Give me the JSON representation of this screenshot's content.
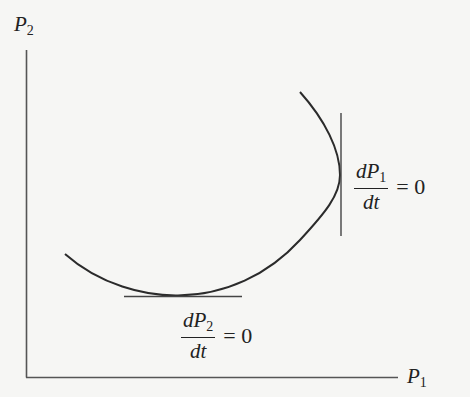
{
  "diagram": {
    "axes": {
      "y_label": {
        "var": "P",
        "sub": "2"
      },
      "x_label": {
        "var": "P",
        "sub": "1"
      }
    },
    "annotations": [
      {
        "id": "dP1dt",
        "numerator_var": "dP",
        "numerator_sub": "1",
        "denominator": "dt",
        "equals": "= 0",
        "tangent": "vertical"
      },
      {
        "id": "dP2dt",
        "numerator_var": "dP",
        "numerator_sub": "2",
        "denominator": "dt",
        "equals": "= 0",
        "tangent": "horizontal"
      }
    ],
    "curve": {
      "description": "trajectory arc in P1-P2 phase plane",
      "color": "#2b2b2b"
    },
    "colors": {
      "background": "#f6f6f4",
      "ink": "#2a2a2a"
    }
  }
}
